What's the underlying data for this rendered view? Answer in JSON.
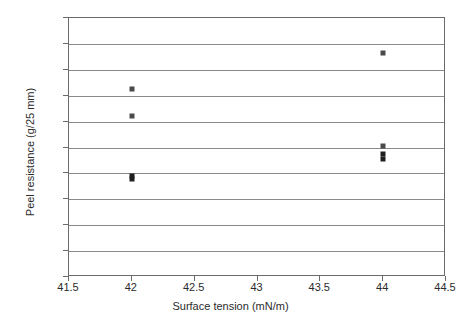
{
  "chart_data": {
    "type": "scatter",
    "title": "",
    "xlabel": "Surface tension (mN/m)",
    "ylabel": "Peel resistance (g/25 mm)",
    "xlim": [
      41.5,
      44.5
    ],
    "ylim": [
      0,
      500
    ],
    "xticks": [
      41.5,
      42,
      42.5,
      43,
      43.5,
      44,
      44.5
    ],
    "xtick_labels": [
      "41.5",
      "42",
      "42.5",
      "43",
      "43.5",
      "44",
      "44.5"
    ],
    "yticks": [
      0,
      50,
      100,
      150,
      200,
      250,
      300,
      350,
      400,
      450,
      500
    ],
    "ytick_labels": [
      "0",
      "50",
      "100",
      "150",
      "200",
      "250",
      "300",
      "350",
      "400",
      "450",
      "500"
    ],
    "grid": "horizontal",
    "legend": "none",
    "marker": "square",
    "marker_color": "#4a4a4a",
    "points": [
      {
        "x": 42,
        "y": 363,
        "shade": "light"
      },
      {
        "x": 42,
        "y": 311,
        "shade": "light"
      },
      {
        "x": 42,
        "y": 196,
        "shade": "dark"
      },
      {
        "x": 42,
        "y": 190,
        "shade": "dark"
      },
      {
        "x": 44,
        "y": 433,
        "shade": "light"
      },
      {
        "x": 44,
        "y": 253,
        "shade": "light"
      },
      {
        "x": 44,
        "y": 237,
        "shade": "dark"
      },
      {
        "x": 44,
        "y": 228,
        "shade": "dark"
      }
    ]
  }
}
